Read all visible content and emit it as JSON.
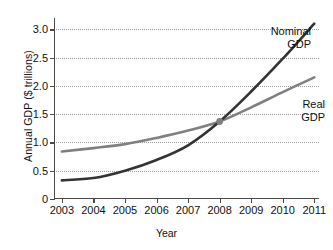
{
  "chart_data": {
    "type": "line",
    "title": "",
    "xlabel": "Year",
    "ylabel": "Annual GDP ($ trillions)",
    "x": [
      2003,
      2004,
      2005,
      2006,
      2007,
      2008,
      2009,
      2010,
      2011
    ],
    "xlim": [
      2002.75,
      2011.15
    ],
    "ylim": [
      0,
      3.2
    ],
    "xtick_labels": [
      "2003",
      "2004",
      "2005",
      "2006",
      "2007",
      "2008",
      "2009",
      "2010",
      "2011"
    ],
    "ytick_values": [
      0,
      0.5,
      1.0,
      1.5,
      2.0,
      2.5,
      3.0
    ],
    "ytick_labels": [
      "0",
      "0.5",
      "1.0",
      "1.5",
      "2.0",
      "2.5",
      "3.0"
    ],
    "grid": "horizontal-dotted",
    "legend_position": "inline-right",
    "series": [
      {
        "name": "Nominal GDP",
        "label_line1": "Nominal",
        "label_line2": "GDP",
        "color": "#333333",
        "values": [
          0.33,
          0.37,
          0.5,
          0.69,
          0.95,
          1.37,
          1.9,
          2.48,
          3.1
        ]
      },
      {
        "name": "Real GDP",
        "label_line1": "Real",
        "label_line2": "GDP",
        "color": "#808080",
        "values": [
          0.84,
          0.9,
          0.97,
          1.08,
          1.21,
          1.37,
          1.62,
          1.89,
          2.15
        ]
      }
    ],
    "annotations": [
      {
        "name": "intersection-marker",
        "x": 2008,
        "y": 1.37,
        "color": "#808080"
      }
    ]
  }
}
